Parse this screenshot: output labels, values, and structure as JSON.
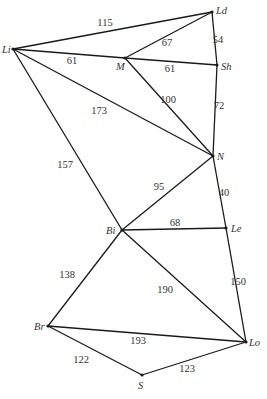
{
  "graph": {
    "nodes": [
      {
        "id": "Li",
        "label": "Li",
        "x": 13,
        "y": 49,
        "lx": 2,
        "ly": 53
      },
      {
        "id": "Ld",
        "label": "Ld",
        "x": 212,
        "y": 12,
        "lx": 216,
        "ly": 14
      },
      {
        "id": "M",
        "label": "M",
        "x": 125,
        "y": 58,
        "lx": 116,
        "ly": 70
      },
      {
        "id": "Sh",
        "label": "Sh",
        "x": 217,
        "y": 65,
        "lx": 221,
        "ly": 70
      },
      {
        "id": "N",
        "label": "N",
        "x": 213,
        "y": 156,
        "lx": 217,
        "ly": 160
      },
      {
        "id": "Bi",
        "label": "Bi",
        "x": 122,
        "y": 230,
        "lx": 106,
        "ly": 234
      },
      {
        "id": "Le",
        "label": "Le",
        "x": 226,
        "y": 228,
        "lx": 231,
        "ly": 232
      },
      {
        "id": "Br",
        "label": "Br",
        "x": 48,
        "y": 326,
        "lx": 34,
        "ly": 330
      },
      {
        "id": "Lo",
        "label": "Lo",
        "x": 246,
        "y": 342,
        "lx": 249,
        "ly": 346
      },
      {
        "id": "S",
        "label": "S",
        "x": 142,
        "y": 375,
        "lx": 138,
        "ly": 389
      }
    ],
    "edges": [
      {
        "from": "Li",
        "to": "Ld",
        "weight": "115",
        "lx": 105,
        "ly": 26
      },
      {
        "from": "Li",
        "to": "M",
        "weight": "61",
        "lx": 72,
        "ly": 64
      },
      {
        "from": "M",
        "to": "Ld",
        "weight": "67",
        "lx": 167,
        "ly": 46
      },
      {
        "from": "M",
        "to": "Sh",
        "weight": "61",
        "lx": 170,
        "ly": 72
      },
      {
        "from": "Ld",
        "to": "Sh",
        "weight": "54",
        "lx": 218,
        "ly": 43
      },
      {
        "from": "Li",
        "to": "N",
        "weight": "173",
        "lx": 99,
        "ly": 114
      },
      {
        "from": "M",
        "to": "N",
        "weight": "100",
        "lx": 168,
        "ly": 103
      },
      {
        "from": "Sh",
        "to": "N",
        "weight": "72",
        "lx": 219,
        "ly": 109
      },
      {
        "from": "Li",
        "to": "Bi",
        "weight": "157",
        "lx": 65,
        "ly": 168
      },
      {
        "from": "N",
        "to": "Bi",
        "weight": "95",
        "lx": 159,
        "ly": 190
      },
      {
        "from": "N",
        "to": "Le",
        "weight": "40",
        "lx": 224,
        "ly": 196
      },
      {
        "from": "Bi",
        "to": "Le",
        "weight": "68",
        "lx": 175,
        "ly": 226
      },
      {
        "from": "Bi",
        "to": "Br",
        "weight": "138",
        "lx": 67,
        "ly": 278
      },
      {
        "from": "Bi",
        "to": "Lo",
        "weight": "190",
        "lx": 165,
        "ly": 293
      },
      {
        "from": "Le",
        "to": "Lo",
        "weight": "150",
        "lx": 238,
        "ly": 285
      },
      {
        "from": "Br",
        "to": "Lo",
        "weight": "193",
        "lx": 138,
        "ly": 344
      },
      {
        "from": "Br",
        "to": "S",
        "weight": "122",
        "lx": 81,
        "ly": 363
      },
      {
        "from": "S",
        "to": "Lo",
        "weight": "123",
        "lx": 187,
        "ly": 372
      }
    ]
  }
}
